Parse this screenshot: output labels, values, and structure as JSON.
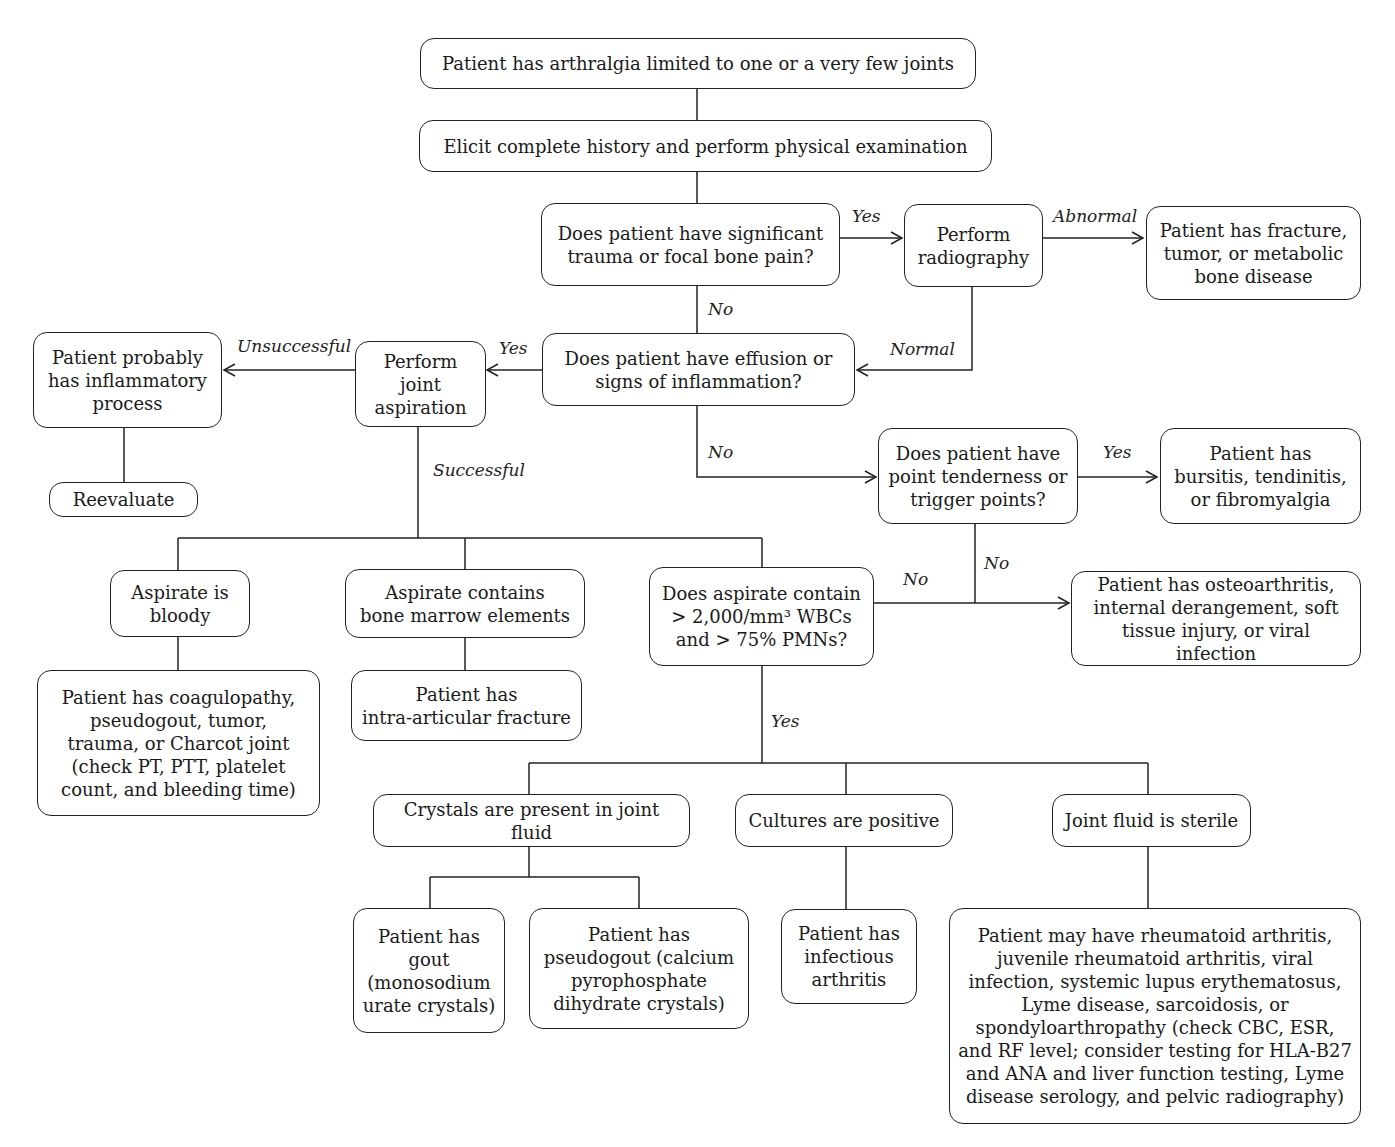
{
  "nodes": {
    "start": "Patient has arthralgia limited to one or a very few joints",
    "history": "Elicit complete history and perform physical examination",
    "trauma_q": "Does patient have significant\ntrauma or focal bone pain?",
    "radiography": "Perform\nradiography",
    "fracture": "Patient has  fracture,\ntumor, or metabolic\nbone disease",
    "effusion_q": "Does patient have effusion or\nsigns of inflammation?",
    "aspiration": "Perform\njoint\naspiration",
    "inflammatory": "Patient probably\nhas inflammatory\nprocess",
    "reevaluate": "Reevaluate",
    "tenderness_q": "Does patient have\npoint tenderness or\ntrigger points?",
    "bursitis": "Patient has\nbursitis, tendinitis,\nor fibromyalgia",
    "osteoarthritis": "Patient has osteoarthritis,\ninternal derangement, soft\ntissue injury, or viral infection",
    "bloody": "Aspirate is\nbloody",
    "marrow": "Aspirate contains\nbone marrow elements",
    "wbc_q": "Does aspirate contain\n> 2,000/mm³ WBCs\nand > 75% PMNs?",
    "coagulopathy": "Patient has coagulopathy,\npseudogout, tumor,\ntrauma, or Charcot joint\n(check PT, PTT, platelet\ncount, and bleeding time)",
    "intra_fracture": "Patient has\nintra-articular fracture",
    "crystals": "Crystals are present in joint fluid",
    "cultures": "Cultures are positive",
    "sterile": "Joint fluid is sterile",
    "gout": "Patient has\ngout\n(monosodium\nurate crystals)",
    "pseudogout": "Patient has\npseudogout (calcium\npyrophosphate\ndihydrate crystals)",
    "infectious": "Patient has\ninfectious\narthritis",
    "rheumatoid": "Patient may have rheumatoid arthritis,\njuvenile rheumatoid arthritis, viral\ninfection, systemic lupus erythematosus,\nLyme disease, sarcoidosis, or\nspondyloarthropathy (check CBC, ESR,\nand RF level; consider testing for HLA-B27\nand ANA and liver function testing, Lyme\ndisease serology, and pelvic radiography)"
  },
  "edge_labels": {
    "trauma_yes": "Yes",
    "radiography_abnormal": "Abnormal",
    "trauma_no": "No",
    "radiography_normal": "Normal",
    "effusion_yes": "Yes",
    "aspiration_unsuccessful": "Unsuccessful",
    "aspiration_successful": "Successful",
    "effusion_no": "No",
    "tenderness_yes": "Yes",
    "tenderness_no": "No",
    "wbc_no": "No",
    "wbc_yes": "Yes"
  }
}
